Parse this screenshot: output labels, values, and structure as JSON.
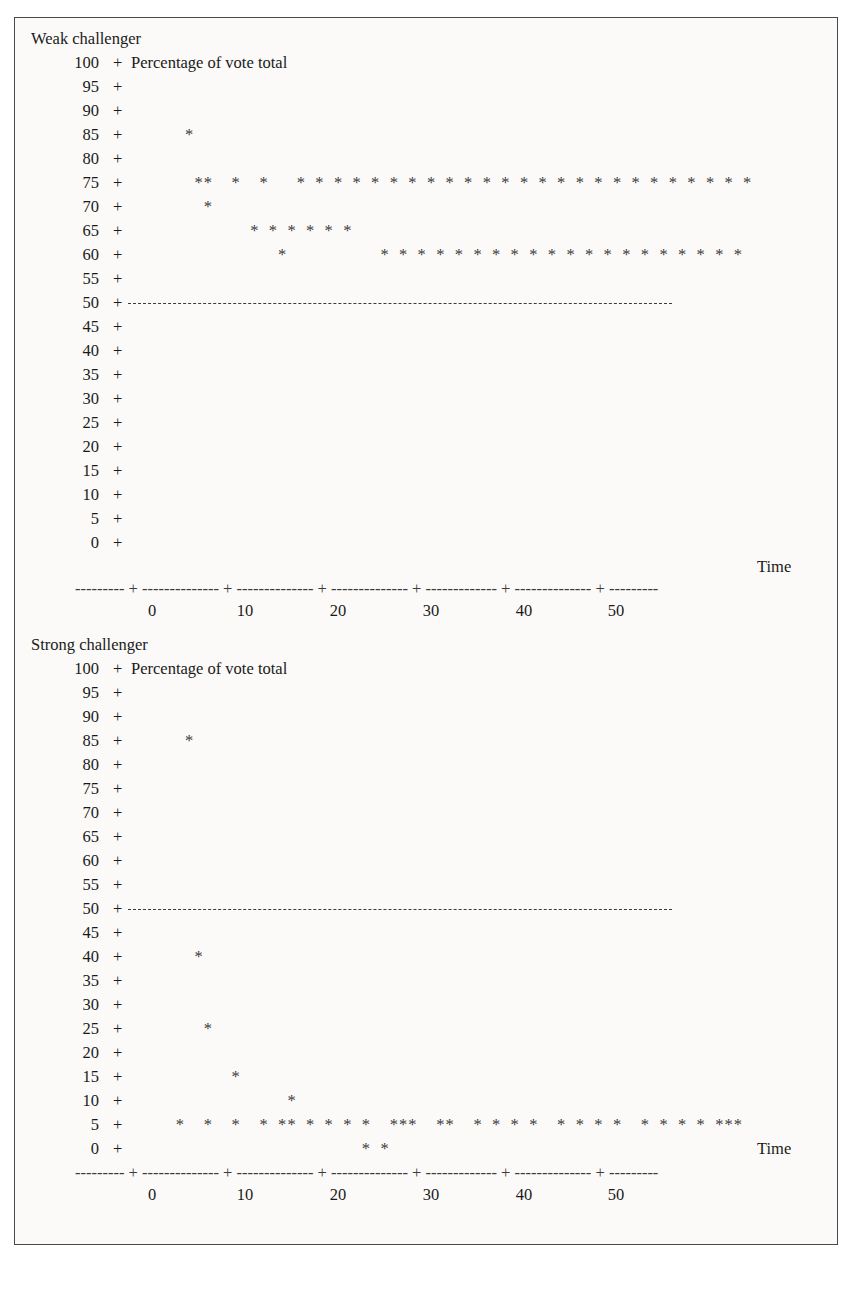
{
  "figure": {
    "background_color": "#fbfaf8",
    "ink_color": "#1a1a1a",
    "time_axis_label": "Time",
    "y_axis_label": "Percentage of vote total",
    "tick_glyph": "+",
    "point_glyph": "*",
    "axis_rule": "--------- + -------------- + -------------- + -------------- + ------------- + -------------- + ---------"
  },
  "panels": [
    {
      "id": "weak",
      "title": "Weak challenger",
      "y_axis_label": "Percentage of vote total",
      "x_axis_label": "Time",
      "y_ticks": [
        "100",
        "95",
        "90",
        "85",
        "80",
        "75",
        "70",
        "65",
        "60",
        "55",
        "50",
        "45",
        "40",
        "35",
        "30",
        "25",
        "20",
        "15",
        "10",
        "5",
        "0"
      ],
      "x_ticks": [
        "0",
        "10",
        "20",
        "30",
        "40",
        "50"
      ],
      "reference_line_value": 50
    },
    {
      "id": "strong",
      "title": "Strong challenger",
      "y_axis_label": "Percentage of vote total",
      "x_axis_label": "Time",
      "y_ticks": [
        "100",
        "95",
        "90",
        "85",
        "80",
        "75",
        "70",
        "65",
        "60",
        "55",
        "50",
        "45",
        "40",
        "35",
        "30",
        "25",
        "20",
        "15",
        "10",
        "5",
        "0"
      ],
      "x_ticks": [
        "0",
        "10",
        "20",
        "30",
        "40",
        "50"
      ],
      "reference_line_value": 50
    }
  ],
  "chart_data": [
    {
      "type": "scatter",
      "title": "Weak challenger",
      "xlabel": "Time",
      "ylabel": "Percentage of vote total",
      "xlim": [
        -5,
        66
      ],
      "ylim": [
        0,
        100
      ],
      "ytick_step": 5,
      "xtick_step": 10,
      "grid": false,
      "legend": "none",
      "reference_line": {
        "y": 50,
        "style": "dashed",
        "x_start": -2,
        "x_end": 50
      },
      "x": [
        4,
        5,
        6,
        9,
        12,
        6,
        11,
        13,
        15,
        17,
        19,
        21,
        14,
        16,
        18,
        20,
        22,
        24,
        26,
        28,
        30,
        32,
        34,
        36,
        38,
        40,
        42,
        44,
        46,
        48,
        50,
        52,
        54,
        56,
        58,
        60,
        62,
        64,
        25,
        27,
        29,
        31,
        33,
        35,
        37,
        39,
        41,
        43,
        45,
        47,
        49,
        51,
        53,
        55,
        57,
        59,
        61,
        63
      ],
      "y": [
        85,
        75,
        75,
        75,
        75,
        70,
        65,
        65,
        65,
        65,
        65,
        65,
        60,
        75,
        75,
        75,
        75,
        75,
        75,
        75,
        75,
        75,
        75,
        75,
        75,
        75,
        75,
        75,
        75,
        75,
        75,
        75,
        75,
        75,
        75,
        75,
        75,
        75,
        60,
        60,
        60,
        60,
        60,
        60,
        60,
        60,
        60,
        60,
        60,
        60,
        60,
        60,
        60,
        60,
        60,
        60,
        60,
        60
      ]
    },
    {
      "type": "scatter",
      "title": "Strong challenger",
      "xlabel": "Time",
      "ylabel": "Percentage of vote total",
      "xlim": [
        -5,
        66
      ],
      "ylim": [
        0,
        100
      ],
      "ytick_step": 5,
      "xtick_step": 10,
      "grid": false,
      "legend": "none",
      "reference_line": {
        "y": 50,
        "style": "dashed",
        "x_start": -2,
        "x_end": 50
      },
      "x": [
        4,
        5,
        6,
        9,
        15,
        3,
        6,
        9,
        12,
        14,
        15,
        17,
        19,
        21,
        23,
        26,
        27,
        28,
        31,
        32,
        35,
        37,
        39,
        41,
        44,
        46,
        48,
        50,
        53,
        55,
        57,
        59,
        61,
        62,
        63,
        23,
        25
      ],
      "y": [
        85,
        40,
        25,
        15,
        10,
        5,
        5,
        5,
        5,
        5,
        5,
        5,
        5,
        5,
        5,
        5,
        5,
        5,
        5,
        5,
        5,
        5,
        5,
        5,
        5,
        5,
        5,
        5,
        5,
        5,
        5,
        5,
        5,
        5,
        5,
        0,
        0
      ]
    }
  ]
}
